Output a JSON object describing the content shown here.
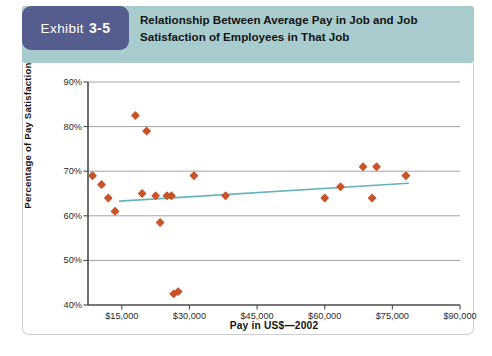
{
  "exhibit": {
    "label_word": "Exhibit",
    "label_number": "3-5",
    "title": "Relationship Between Average Pay in Job and Job Satisfaction of Employees in That Job"
  },
  "colors": {
    "badge": "#545d8e",
    "header_band": "#a8ccce",
    "marker": "#c8542a",
    "trendline": "#63b3bf",
    "gridline": "#9a9a9a",
    "axis": "#4a4a4a"
  },
  "chart_data": {
    "type": "scatter",
    "title": "Relationship Between Average Pay in Job and Job Satisfaction of Employees in That Job",
    "xlabel": "Pay in US$—2002",
    "ylabel": "Percentage of Pay Satisfaction",
    "xlim": [
      7500,
      90000
    ],
    "ylim": [
      40,
      90
    ],
    "xticks": [
      15000,
      30000,
      45000,
      60000,
      75000,
      90000
    ],
    "xtick_labels": [
      "$15,000",
      "$30,000",
      "$45,000",
      "$60,000",
      "$75,000",
      "$90,000"
    ],
    "yticks": [
      40,
      50,
      60,
      70,
      80,
      90
    ],
    "ytick_labels": [
      "40%",
      "50%",
      "60%",
      "70%",
      "80%",
      "90%"
    ],
    "grid": "horizontal",
    "legend": "none",
    "marker_shape": "diamond",
    "series": [
      {
        "name": "Jobs",
        "points": [
          {
            "x": 8500,
            "y": 69
          },
          {
            "x": 10500,
            "y": 67
          },
          {
            "x": 12000,
            "y": 64
          },
          {
            "x": 13500,
            "y": 61
          },
          {
            "x": 18000,
            "y": 82.5
          },
          {
            "x": 20500,
            "y": 79
          },
          {
            "x": 19500,
            "y": 65
          },
          {
            "x": 22500,
            "y": 64.5
          },
          {
            "x": 23500,
            "y": 58.5
          },
          {
            "x": 25000,
            "y": 64.5
          },
          {
            "x": 26000,
            "y": 64.5
          },
          {
            "x": 26500,
            "y": 42.5
          },
          {
            "x": 27500,
            "y": 43
          },
          {
            "x": 31000,
            "y": 69
          },
          {
            "x": 38000,
            "y": 64.5
          },
          {
            "x": 60000,
            "y": 64
          },
          {
            "x": 63500,
            "y": 66.5
          },
          {
            "x": 68500,
            "y": 71
          },
          {
            "x": 71500,
            "y": 71
          },
          {
            "x": 70500,
            "y": 64
          },
          {
            "x": 78000,
            "y": 69
          }
        ]
      }
    ],
    "trendline": {
      "label": "linear fit",
      "x_start": 14500,
      "y_start": 63.3,
      "x_end": 78500,
      "y_end": 67.3
    }
  }
}
